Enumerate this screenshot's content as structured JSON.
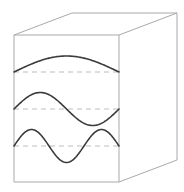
{
  "diagram": {
    "type": "standing-waves-in-box",
    "colors": {
      "background": "#ffffff",
      "box_edge": "#a9a9a9",
      "wave": "#3a3a3a",
      "baseline": "#bdbdbd"
    },
    "box": {
      "front_face": {
        "x1": 14,
        "y1": 35,
        "x2": 119,
        "y2": 182
      },
      "back_top_left": [
        72,
        13
      ],
      "back_top_right": [
        177,
        13
      ],
      "back_bottom_right": [
        177,
        160
      ]
    },
    "waves": [
      {
        "label": "n=1 (half wavelength)",
        "baseline_y": 72,
        "amplitude": 16,
        "half_cycles": 1
      },
      {
        "label": "n=2 (one wavelength)",
        "baseline_y": 109,
        "amplitude": 16.5,
        "half_cycles": 2
      },
      {
        "label": "n=3 (one and a half wavelengths)",
        "baseline_y": 146,
        "amplitude": 16.5,
        "half_cycles": 3
      }
    ],
    "x_start": 14,
    "x_end": 119
  }
}
